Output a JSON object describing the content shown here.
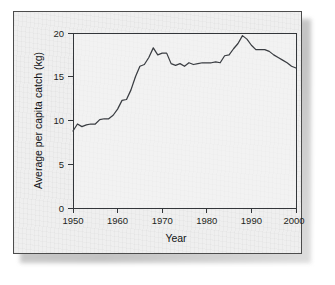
{
  "figure": {
    "background_color": "#efefef",
    "border_color": "#4c4c4c",
    "line_color": "#3a3d42"
  },
  "chart_data": {
    "type": "line",
    "title": "",
    "subtitle": "",
    "xlabel": "Year",
    "ylabel": "Average per capita catch (kg)",
    "xlim": [
      1950,
      2000
    ],
    "ylim": [
      0,
      20
    ],
    "xticks": [
      1950,
      1960,
      1970,
      1980,
      1990,
      2000
    ],
    "xtick_labels": [
      "1950",
      "1960",
      "1970",
      "1980",
      "1990",
      "2000"
    ],
    "yticks": [
      0,
      5,
      10,
      15,
      20
    ],
    "ytick_labels": [
      "0",
      "5",
      "10",
      "15",
      "20"
    ],
    "grid": false,
    "legend": false,
    "legend_position": "none",
    "series": [
      {
        "name": "Average per capita catch",
        "units": "kg",
        "x": [
          1950,
          1951,
          1952,
          1953,
          1954,
          1955,
          1956,
          1957,
          1958,
          1959,
          1960,
          1961,
          1962,
          1963,
          1964,
          1965,
          1966,
          1967,
          1968,
          1969,
          1970,
          1971,
          1972,
          1973,
          1974,
          1975,
          1976,
          1977,
          1978,
          1979,
          1980,
          1981,
          1982,
          1983,
          1984,
          1985,
          1986,
          1987,
          1988,
          1989,
          1990,
          1991,
          1992,
          1993,
          1994,
          1995,
          1996,
          1997,
          1998,
          1999,
          2000
        ],
        "values": [
          8.8,
          9.6,
          9.3,
          9.5,
          9.6,
          9.6,
          10.1,
          10.2,
          10.2,
          10.6,
          11.3,
          12.3,
          12.4,
          13.5,
          15.0,
          16.2,
          16.4,
          17.2,
          18.3,
          17.5,
          17.7,
          17.7,
          16.5,
          16.3,
          16.5,
          16.2,
          16.6,
          16.4,
          16.5,
          16.6,
          16.6,
          16.6,
          16.7,
          16.6,
          17.4,
          17.5,
          18.2,
          18.8,
          19.7,
          19.3,
          18.6,
          18.1,
          18.1,
          18.1,
          17.9,
          17.5,
          17.2,
          16.9,
          16.6,
          16.2,
          16.0
        ]
      }
    ],
    "annotations": []
  }
}
